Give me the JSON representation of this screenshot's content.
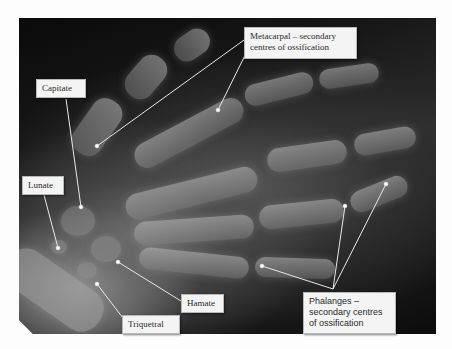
{
  "figure": {
    "type": "hand-radiograph",
    "background_color": "#fdfdfd",
    "image_frame_color": "#111111",
    "label_box_color": "#f4f4f4",
    "leader_line_color": "#e8e8e8"
  },
  "labels": {
    "metacarpal": "Metacarpal – secondary centres of ossification",
    "capitate": "Capitate",
    "lunate": "Lunate",
    "hamate": "Hamate",
    "triquetral": "Triquetral",
    "phalanges": "Phalanges – secondary centres of ossification"
  },
  "label_lines": {
    "metacarpal": [
      "Metacarpal – secondary",
      "centres of ossification"
    ],
    "phalanges": [
      "Phalanges –",
      "secondary centres",
      "of ossification"
    ]
  }
}
